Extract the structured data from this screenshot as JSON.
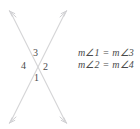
{
  "figure": {
    "background_color": "#ffffff",
    "line_color": "#d5d5d7",
    "text_color": "#4a4a4a"
  },
  "angle_labels": {
    "top": "3",
    "left": "4",
    "right": "2",
    "bottom": "1"
  },
  "equations": [
    "m∠1 = m∠3",
    "m∠2 = m∠4"
  ],
  "geometry": {
    "intersection": {
      "x": 38,
      "y": 67
    },
    "line_a": {
      "x1": 10,
      "y1": 122,
      "x2": 66,
      "y2": 12
    },
    "line_b": {
      "x1": 10,
      "y1": 12,
      "x2": 66,
      "y2": 122
    },
    "arrowheads": 4
  }
}
